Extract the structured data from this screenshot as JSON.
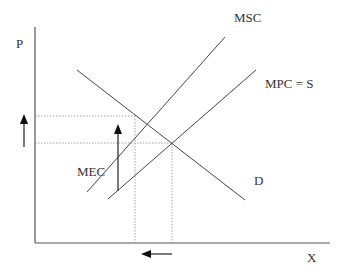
{
  "diagram": {
    "axes": {
      "y_label": "P",
      "x_label": "X"
    },
    "curves": [
      {
        "id": "msc",
        "label": "MSC",
        "type": "supply-social"
      },
      {
        "id": "mpc",
        "label": "MPC = S",
        "type": "supply-private"
      },
      {
        "id": "d",
        "label": "D",
        "type": "demand"
      }
    ],
    "annotations": {
      "mec_label": "MEC",
      "price_arrow": "up",
      "quantity_arrow": "left"
    },
    "colors": {
      "line": "#444444",
      "axis": "#555555",
      "guide": "#888888",
      "arrow": "#111111",
      "text": "#333333"
    }
  }
}
